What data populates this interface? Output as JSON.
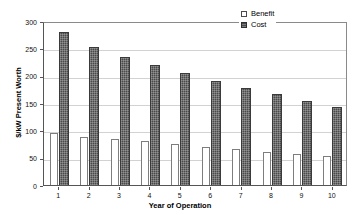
{
  "chart_data": {
    "type": "bar",
    "title": "",
    "xlabel": "Year of Operation",
    "ylabel": "$/kW Present Worth",
    "categories": [
      "1",
      "2",
      "3",
      "4",
      "5",
      "6",
      "7",
      "8",
      "9",
      "10"
    ],
    "series": [
      {
        "name": "Benefit",
        "values": [
          96,
          88,
          84,
          80,
          75,
          70,
          66,
          61,
          57,
          53
        ],
        "color": "#ffffff"
      },
      {
        "name": "Cost",
        "values": [
          279,
          252,
          234,
          219,
          205,
          190,
          177,
          166,
          154,
          143
        ],
        "color": "#4a4a4a"
      }
    ],
    "ylim": [
      0,
      300
    ],
    "yticks": [
      0,
      50,
      100,
      150,
      200,
      250,
      300
    ],
    "ytick_labels": [
      "0",
      "50",
      "100",
      "150",
      "200",
      "250",
      "300"
    ],
    "grid": true,
    "legend_position": "top-right"
  },
  "legend": {
    "items": [
      {
        "label": "Benefit",
        "swatch": "benefit-swatch"
      },
      {
        "label": "Cost",
        "swatch": "cost-swatch"
      }
    ]
  }
}
